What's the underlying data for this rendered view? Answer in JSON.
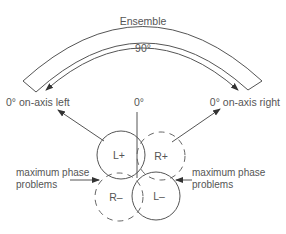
{
  "diagram": {
    "ensemble_label": "Ensemble",
    "angle_label": "90°",
    "center_label": "0°",
    "left_axis_label": "0° on-axis left",
    "right_axis_label": "0° on-axis right",
    "left_problem_label_line1": "maximum phase",
    "left_problem_label_line2": "problems",
    "right_problem_label_line1": "maximum phase",
    "right_problem_label_line2": "problems",
    "lobes": [
      {
        "name": "L+",
        "style": "solid",
        "position": "upper-left"
      },
      {
        "name": "R+",
        "style": "dashed",
        "position": "upper-right"
      },
      {
        "name": "R–",
        "style": "dashed",
        "position": "lower-left"
      },
      {
        "name": "L–",
        "style": "solid",
        "position": "lower-right"
      }
    ]
  },
  "colors": {
    "line": "#555555",
    "text": "#555555",
    "background": "#ffffff"
  }
}
